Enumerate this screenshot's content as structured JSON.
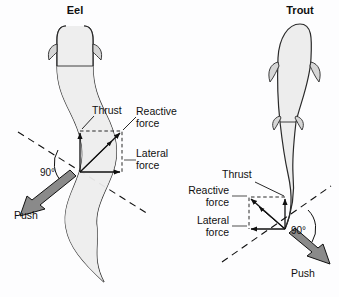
{
  "figure": {
    "background_color": "#fdfdfe",
    "ink_color": "#101010",
    "body_fill": "#ededed",
    "arrow_fill": "#8a8a8a",
    "view": "dorsal"
  },
  "panels": [
    {
      "id": "eel",
      "title": "Eel",
      "title_pos": {
        "x": 75,
        "y": 14
      },
      "body_shape": "undulating-s-curve",
      "labels": {
        "thrust": "Thrust",
        "reactive_force_line1": "Reactive",
        "reactive_force_line2": "force",
        "lateral_force_line1": "Lateral",
        "lateral_force_line2": "force",
        "angle": "90°",
        "push": "Push"
      },
      "label_pos": {
        "thrust": {
          "x": 92,
          "y": 110
        },
        "reactive": {
          "x": 138,
          "y": 112
        },
        "lateral": {
          "x": 138,
          "y": 157
        },
        "angle": {
          "x": 45,
          "y": 176
        },
        "push": {
          "x": 14,
          "y": 216
        }
      },
      "vector_origin": {
        "x": 80,
        "y": 172
      },
      "thrust_tip": {
        "x": 80,
        "y": 131
      },
      "lateral_tip": {
        "x": 122,
        "y": 172
      },
      "reactive_tip": {
        "x": 122,
        "y": 131
      },
      "push_dir": "down-left"
    },
    {
      "id": "trout",
      "title": "Trout",
      "title_pos": {
        "x": 300,
        "y": 14
      },
      "body_shape": "rigid-oval-with-tail-bend",
      "labels": {
        "thrust": "Thrust",
        "reactive_force_line1": "Reactive",
        "reactive_force_line2": "force",
        "lateral_force_line1": "Lateral",
        "lateral_force_line2": "force",
        "angle": "90°",
        "push": "Push"
      },
      "label_pos": {
        "thrust": {
          "x": 222,
          "y": 190
        },
        "reactive": {
          "x": 186,
          "y": 193
        },
        "lateral": {
          "x": 186,
          "y": 222
        },
        "angle": {
          "x": 300,
          "y": 232
        },
        "push": {
          "x": 291,
          "y": 273
        }
      },
      "vector_origin": {
        "x": 285,
        "y": 229
      },
      "thrust_tip": {
        "x": 285,
        "y": 197
      },
      "lateral_tip": {
        "x": 249,
        "y": 229
      },
      "reactive_tip": {
        "x": 249,
        "y": 197
      },
      "push_dir": "down-right"
    }
  ]
}
